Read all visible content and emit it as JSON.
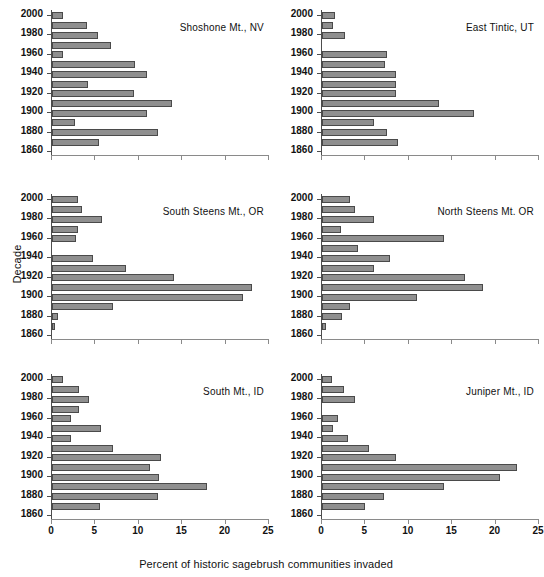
{
  "axes": {
    "ylabel": "Decade",
    "xlabel": "Percent of historic sagebrush communities invaded",
    "xticks": [
      "0",
      "5",
      "10",
      "15",
      "20",
      "25"
    ],
    "yticks": [
      "2000",
      "1980",
      "1960",
      "1940",
      "1920",
      "1900",
      "1880",
      "1860"
    ]
  },
  "chart_data": {
    "type": "bar",
    "title": "",
    "xlabel": "Percent of historic sagebrush communities invaded",
    "ylabel": "Decade",
    "xlim": [
      0,
      25
    ],
    "grid": false,
    "legend": "none",
    "orientation": "horizontal",
    "categories": [
      2000,
      1990,
      1980,
      1970,
      1960,
      1950,
      1940,
      1930,
      1920,
      1910,
      1900,
      1890,
      1880,
      1870,
      1860
    ],
    "panels": [
      {
        "name": "Shoshone Mt., NV",
        "position": "top-left",
        "values": [
          1.3,
          4.0,
          5.3,
          6.8,
          1.3,
          9.6,
          11.0,
          4.2,
          9.5,
          13.8,
          11.0,
          2.6,
          12.2,
          5.4,
          0
        ]
      },
      {
        "name": "East Tintic, UT",
        "position": "top-right",
        "values": [
          1.5,
          1.3,
          2.7,
          0,
          7.5,
          7.3,
          8.5,
          8.5,
          8.5,
          13.5,
          17.5,
          6.0,
          7.5,
          8.8,
          0
        ]
      },
      {
        "name": "South Steens Mt., OR",
        "position": "middle-left",
        "values": [
          3.0,
          3.5,
          5.8,
          3.0,
          2.8,
          0,
          4.7,
          8.5,
          14.0,
          23.0,
          22.0,
          7.0,
          0.7,
          0.4,
          0
        ]
      },
      {
        "name": "North Steens Mt. OR",
        "position": "middle-right",
        "values": [
          3.2,
          3.8,
          6.0,
          2.2,
          14.0,
          4.1,
          7.8,
          6.0,
          16.5,
          18.5,
          11.0,
          3.2,
          2.3,
          0.5,
          0
        ]
      },
      {
        "name": "South Mt., ID",
        "position": "bottom-left",
        "values": [
          1.3,
          3.1,
          4.3,
          3.1,
          2.2,
          5.6,
          2.2,
          7.0,
          12.5,
          11.3,
          12.3,
          17.8,
          12.2,
          5.5,
          0
        ]
      },
      {
        "name": "Juniper Mt., ID",
        "position": "bottom-right",
        "values": [
          1.2,
          2.5,
          3.8,
          0,
          1.8,
          1.3,
          3.0,
          5.4,
          8.5,
          22.5,
          20.5,
          14.0,
          7.2,
          5.0,
          0
        ]
      }
    ]
  },
  "colors": {
    "bar_fill": "#8f8f8f",
    "bar_border": "#4a4a4a",
    "axis": "#4d4d4d",
    "text": "#111111"
  }
}
